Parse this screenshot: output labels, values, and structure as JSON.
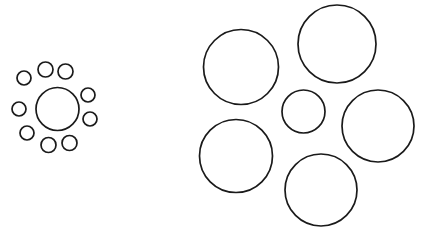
{
  "figure": {
    "type": "ebbinghaus-illusion",
    "canvas": {
      "width": 422,
      "height": 237
    },
    "background_color": "#ffffff",
    "stroke_color": "#1a1a1a",
    "stroke_width": 1.7,
    "fill": "none"
  },
  "left_cluster": {
    "name": "small-inducers-cluster",
    "target": {
      "name": "left-target-circle",
      "cx": 57.5,
      "cy": 109,
      "r": 21.5,
      "diameter": 43
    },
    "inducers": [
      {
        "name": "left-inducer-1",
        "cx": 45.5,
        "cy": 69.5,
        "r": 7.5,
        "diameter": 15
      },
      {
        "name": "left-inducer-2",
        "cx": 65.5,
        "cy": 71.5,
        "r": 7.5,
        "diameter": 15
      },
      {
        "name": "left-inducer-3",
        "cx": 88.0,
        "cy": 95.0,
        "r": 7.0,
        "diameter": 14
      },
      {
        "name": "left-inducer-4",
        "cx": 90.0,
        "cy": 119.0,
        "r": 7.0,
        "diameter": 14
      },
      {
        "name": "left-inducer-5",
        "cx": 69.5,
        "cy": 143.0,
        "r": 7.5,
        "diameter": 15
      },
      {
        "name": "left-inducer-6",
        "cx": 48.5,
        "cy": 145.0,
        "r": 7.5,
        "diameter": 15
      },
      {
        "name": "left-inducer-7",
        "cx": 27.0,
        "cy": 133.0,
        "r": 7.0,
        "diameter": 14
      },
      {
        "name": "left-inducer-8",
        "cx": 19.0,
        "cy": 109.0,
        "r": 7.0,
        "diameter": 14
      },
      {
        "name": "left-inducer-9",
        "cx": 24.0,
        "cy": 78.0,
        "r": 7.0,
        "diameter": 14
      }
    ],
    "inducer_count": 9
  },
  "right_cluster": {
    "name": "large-inducers-cluster",
    "target": {
      "name": "right-target-circle",
      "cx": 303.5,
      "cy": 111.5,
      "r": 21.5,
      "diameter": 43
    },
    "inducers": [
      {
        "name": "right-inducer-top-left",
        "cx": 241.0,
        "cy": 67.0,
        "r": 37.5,
        "diameter": 75
      },
      {
        "name": "right-inducer-top-right",
        "cx": 337.0,
        "cy": 44.0,
        "r": 39.0,
        "diameter": 78
      },
      {
        "name": "right-inducer-middle-right",
        "cx": 378.0,
        "cy": 126.0,
        "r": 36.0,
        "diameter": 72
      },
      {
        "name": "right-inducer-bottom-left",
        "cx": 236.0,
        "cy": 156.0,
        "r": 36.5,
        "diameter": 73
      },
      {
        "name": "right-inducer-bottom-middle",
        "cx": 321.0,
        "cy": 190.0,
        "r": 36.0,
        "diameter": 72
      }
    ],
    "inducer_count": 5
  },
  "chart_data": {
    "type": "scatter",
    "title": "",
    "xlabel": "",
    "ylabel": "",
    "xlim": [
      0,
      422
    ],
    "ylim": [
      0,
      237
    ],
    "grid": false,
    "legend": null,
    "series": [
      {
        "name": "left-target",
        "values": [
          {
            "x": 57.5,
            "y": 109,
            "r": 21.5
          }
        ]
      },
      {
        "name": "left-inducers",
        "values": [
          {
            "x": 45.5,
            "y": 69.5,
            "r": 7.5
          },
          {
            "x": 65.5,
            "y": 71.5,
            "r": 7.5
          },
          {
            "x": 88.0,
            "y": 95.0,
            "r": 7.0
          },
          {
            "x": 90.0,
            "y": 119.0,
            "r": 7.0
          },
          {
            "x": 69.5,
            "y": 143.0,
            "r": 7.5
          },
          {
            "x": 48.5,
            "y": 145.0,
            "r": 7.5
          },
          {
            "x": 27.0,
            "y": 133.0,
            "r": 7.0
          },
          {
            "x": 19.0,
            "y": 109.0,
            "r": 7.0
          },
          {
            "x": 24.0,
            "y": 78.0,
            "r": 7.0
          }
        ]
      },
      {
        "name": "right-target",
        "values": [
          {
            "x": 303.5,
            "y": 111.5,
            "r": 21.5
          }
        ]
      },
      {
        "name": "right-inducers",
        "values": [
          {
            "x": 241.0,
            "y": 67.0,
            "r": 37.5
          },
          {
            "x": 337.0,
            "y": 44.0,
            "r": 39.0
          },
          {
            "x": 378.0,
            "y": 126.0,
            "r": 36.0
          },
          {
            "x": 236.0,
            "y": 156.0,
            "r": 36.5
          },
          {
            "x": 321.0,
            "y": 190.0,
            "r": 36.0
          }
        ]
      }
    ]
  }
}
